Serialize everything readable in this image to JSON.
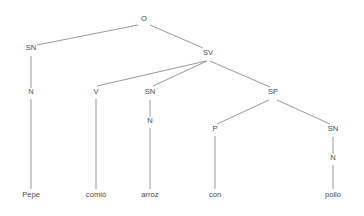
{
  "figure": {
    "kind": "syntax-tree-diagram",
    "sentence": "Pepe comió arroz con pollo",
    "language": "es",
    "background_color": "#ffffff",
    "line_color": "#8d8d8d",
    "text_color": "#4a4a4a"
  },
  "nodes": {
    "o": {
      "label": "O",
      "x": 144,
      "y": 21
    },
    "sn_subject": {
      "label": "SN",
      "x": 31,
      "y": 50
    },
    "sv": {
      "label": "SV",
      "x": 208,
      "y": 55
    },
    "n_subject": {
      "label": "N",
      "x": 31,
      "y": 94
    },
    "v": {
      "label": "V",
      "x": 96,
      "y": 94
    },
    "sn_object": {
      "label": "SN",
      "x": 150,
      "y": 94
    },
    "sp": {
      "label": "SP",
      "x": 273,
      "y": 94
    },
    "n_object": {
      "label": "N",
      "x": 150,
      "y": 123
    },
    "p": {
      "label": "P",
      "x": 215,
      "y": 131
    },
    "sn_prep": {
      "label": "SN",
      "x": 333,
      "y": 131
    },
    "n_prep": {
      "label": "N",
      "x": 333,
      "y": 160
    }
  },
  "leaves": {
    "pepe": {
      "label": "Pepe",
      "x": 31,
      "y": 197
    },
    "comio": {
      "label": "comió",
      "x": 96,
      "y": 197
    },
    "arroz": {
      "label": "arroz",
      "x": 150,
      "y": 197
    },
    "con": {
      "label": "con",
      "x": 215,
      "y": 197
    },
    "pollo": {
      "label": "pollo",
      "x": 333,
      "y": 197
    }
  },
  "edges": [
    {
      "name": "edge-o-to-sn-subject",
      "x1": 138,
      "y1": 25,
      "x2": 37,
      "y2": 45
    },
    {
      "name": "edge-o-to-sv",
      "x1": 150,
      "y1": 25,
      "x2": 203,
      "y2": 48
    },
    {
      "name": "edge-sn-subject-to-n-subject",
      "x1": 31,
      "y1": 56,
      "x2": 31,
      "y2": 88
    },
    {
      "name": "edge-sv-to-v",
      "x1": 206,
      "y1": 61,
      "x2": 97,
      "y2": 86
    },
    {
      "name": "edge-sv-to-sn-object",
      "x1": 207,
      "y1": 61,
      "x2": 153,
      "y2": 86
    },
    {
      "name": "edge-sv-to-sp",
      "x1": 210,
      "y1": 61,
      "x2": 270,
      "y2": 87
    },
    {
      "name": "edge-n-subject-to-pepe",
      "x1": 31,
      "y1": 99,
      "x2": 31,
      "y2": 189
    },
    {
      "name": "edge-v-to-comio",
      "x1": 96,
      "y1": 99,
      "x2": 96,
      "y2": 189
    },
    {
      "name": "edge-sn-object-to-n-object",
      "x1": 150,
      "y1": 100,
      "x2": 150,
      "y2": 117
    },
    {
      "name": "edge-n-object-to-arroz",
      "x1": 150,
      "y1": 128,
      "x2": 150,
      "y2": 189
    },
    {
      "name": "edge-sp-to-p",
      "x1": 269,
      "y1": 100,
      "x2": 217,
      "y2": 124
    },
    {
      "name": "edge-sp-to-sn-prep",
      "x1": 277,
      "y1": 100,
      "x2": 330,
      "y2": 124
    },
    {
      "name": "edge-p-to-con",
      "x1": 215,
      "y1": 136,
      "x2": 215,
      "y2": 189
    },
    {
      "name": "edge-sn-prep-to-n-prep",
      "x1": 333,
      "y1": 137,
      "x2": 333,
      "y2": 154
    },
    {
      "name": "edge-n-prep-to-pollo",
      "x1": 333,
      "y1": 165,
      "x2": 333,
      "y2": 189
    }
  ]
}
